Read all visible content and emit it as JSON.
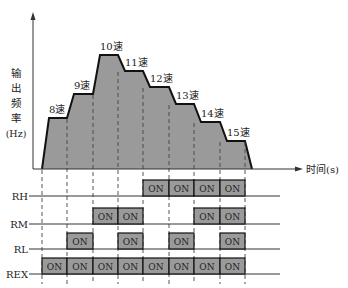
{
  "diagram": {
    "y_axis_label_lines": [
      "输",
      "出",
      "频",
      "率",
      "(Hz)"
    ],
    "x_axis_label": "时间(s)",
    "speeds": [
      {
        "label": "8速",
        "level": 118
      },
      {
        "label": "9速",
        "level": 94
      },
      {
        "label": "10速",
        "level": 55
      },
      {
        "label": "11速",
        "level": 71
      },
      {
        "label": "12速",
        "level": 87
      },
      {
        "label": "13速",
        "level": 104
      },
      {
        "label": "14速",
        "level": 122
      },
      {
        "label": "15速",
        "level": 141
      }
    ],
    "signals": [
      {
        "name": "RH",
        "states": [
          0,
          0,
          0,
          0,
          1,
          1,
          1,
          1
        ]
      },
      {
        "name": "RM",
        "states": [
          0,
          0,
          1,
          1,
          0,
          0,
          1,
          1
        ]
      },
      {
        "name": "RL",
        "states": [
          0,
          1,
          0,
          1,
          0,
          1,
          0,
          1
        ]
      },
      {
        "name": "REX",
        "states": [
          1,
          1,
          1,
          1,
          1,
          1,
          1,
          1
        ]
      }
    ],
    "on_label": "ON"
  },
  "chart_data": {
    "type": "step-timing",
    "title": "",
    "xlabel": "时间(s)",
    "ylabel": "输出频率(Hz)",
    "categories": [
      "8速",
      "9速",
      "10速",
      "11速",
      "12速",
      "13速",
      "14速",
      "15速"
    ],
    "relative_frequency": [
      2.6,
      3.9,
      5.9,
      5.1,
      4.3,
      3.4,
      2.5,
      1.5
    ],
    "signals": {
      "RH": [
        "OFF",
        "OFF",
        "OFF",
        "OFF",
        "ON",
        "ON",
        "ON",
        "ON"
      ],
      "RM": [
        "OFF",
        "OFF",
        "ON",
        "ON",
        "OFF",
        "OFF",
        "ON",
        "ON"
      ],
      "RL": [
        "OFF",
        "ON",
        "OFF",
        "ON",
        "OFF",
        "ON",
        "OFF",
        "ON"
      ],
      "REX": [
        "ON",
        "ON",
        "ON",
        "ON",
        "ON",
        "ON",
        "ON",
        "ON"
      ]
    },
    "colors": {
      "fill": "#9a9a9a",
      "line": "#111111"
    }
  }
}
